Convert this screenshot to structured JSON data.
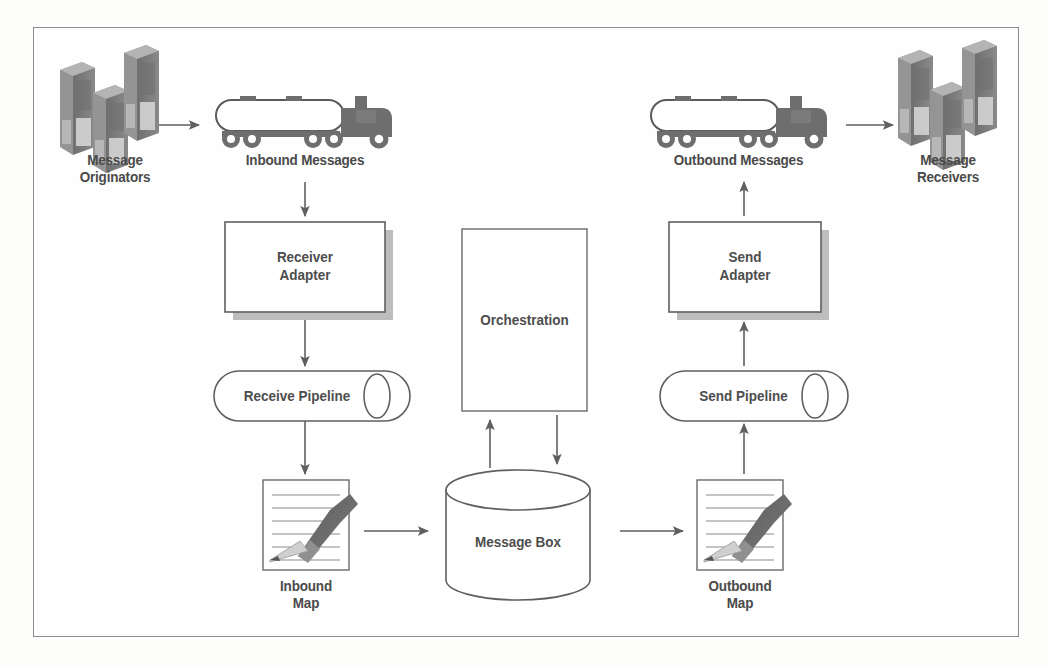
{
  "diagram": {
    "colors": {
      "frame_border": "#8d8d8d",
      "background": "#fefefe",
      "text": "#4a4a4a",
      "line": "#6b6b6b",
      "shadow": "#b8b8b8",
      "server_dark": "#7c7c7c",
      "server_mid": "#9a9a9a",
      "server_light": "#cfcfcf",
      "truck_body": "#6e6e6e",
      "pencil_dark": "#636363",
      "pencil_light": "#c9c9c9"
    },
    "nodes": [
      {
        "id": "message-originators",
        "label": "Message\nOriginators",
        "shape": "server-stack",
        "x": 60,
        "y": 40
      },
      {
        "id": "inbound-messages",
        "label": "Inbound Messages",
        "shape": "truck",
        "x": 213,
        "y": 92
      },
      {
        "id": "receiver-adapter",
        "label": "Receiver\nAdapter",
        "shape": "box-shadow",
        "x": 225,
        "y": 222
      },
      {
        "id": "receive-pipeline",
        "label": "Receive Pipeline",
        "shape": "pipeline",
        "x": 219,
        "y": 371
      },
      {
        "id": "inbound-map",
        "label": "Inbound\nMap",
        "shape": "document-pencil",
        "x": 263,
        "y": 480
      },
      {
        "id": "orchestration",
        "label": "Orchestration",
        "shape": "rect",
        "x": 462,
        "y": 229
      },
      {
        "id": "message-box",
        "label": "Message Box",
        "shape": "cylinder",
        "x": 446,
        "y": 472
      },
      {
        "id": "outbound-map",
        "label": "Outbound\nMap",
        "shape": "document-pencil",
        "x": 697,
        "y": 480
      },
      {
        "id": "send-pipeline",
        "label": "Send Pipeline",
        "shape": "pipeline",
        "x": 665,
        "y": 371
      },
      {
        "id": "send-adapter",
        "label": "Send\nAdapter",
        "shape": "box-shadow",
        "x": 669,
        "y": 222
      },
      {
        "id": "outbound-messages",
        "label": "Outbound Messages",
        "shape": "truck",
        "x": 648,
        "y": 92
      },
      {
        "id": "message-receivers",
        "label": "Message\nReceivers",
        "shape": "server-stack",
        "x": 898,
        "y": 40
      }
    ],
    "labels": {
      "message_originators": "Message\nOriginators",
      "inbound_messages": "Inbound Messages",
      "receiver_adapter": "Receiver\nAdapter",
      "receive_pipeline": "Receive Pipeline",
      "inbound_map": "Inbound\nMap",
      "orchestration": "Orchestration",
      "message_box": "Message Box",
      "outbound_map": "Outbound\nMap",
      "send_pipeline": "Send Pipeline",
      "send_adapter": "Send\nAdapter",
      "outbound_messages": "Outbound Messages",
      "message_receivers": "Message\nReceivers"
    },
    "connectors": [
      {
        "id": "originators-to-truck",
        "from": "message-originators",
        "to": "inbound-messages",
        "direction": "right"
      },
      {
        "id": "truck-to-receiver",
        "from": "inbound-messages",
        "to": "receiver-adapter",
        "direction": "down"
      },
      {
        "id": "receiver-to-pipeline",
        "from": "receiver-adapter",
        "to": "receive-pipeline",
        "direction": "down"
      },
      {
        "id": "pipeline-to-map",
        "from": "receive-pipeline",
        "to": "inbound-map",
        "direction": "down"
      },
      {
        "id": "map-to-messagebox",
        "from": "inbound-map",
        "to": "message-box",
        "direction": "right"
      },
      {
        "id": "messagebox-to-orchestration",
        "from": "message-box",
        "to": "orchestration",
        "direction": "up"
      },
      {
        "id": "orchestration-to-messagebox",
        "from": "orchestration",
        "to": "message-box",
        "direction": "down"
      },
      {
        "id": "messagebox-to-outbound-map",
        "from": "message-box",
        "to": "outbound-map",
        "direction": "right"
      },
      {
        "id": "outbound-map-to-send-pipeline",
        "from": "outbound-map",
        "to": "send-pipeline",
        "direction": "up"
      },
      {
        "id": "send-pipeline-to-send-adapter",
        "from": "send-pipeline",
        "to": "send-adapter",
        "direction": "up"
      },
      {
        "id": "send-adapter-to-truck",
        "from": "send-adapter",
        "to": "outbound-messages",
        "direction": "up"
      },
      {
        "id": "truck-to-receivers",
        "from": "outbound-messages",
        "to": "message-receivers",
        "direction": "right"
      }
    ]
  }
}
